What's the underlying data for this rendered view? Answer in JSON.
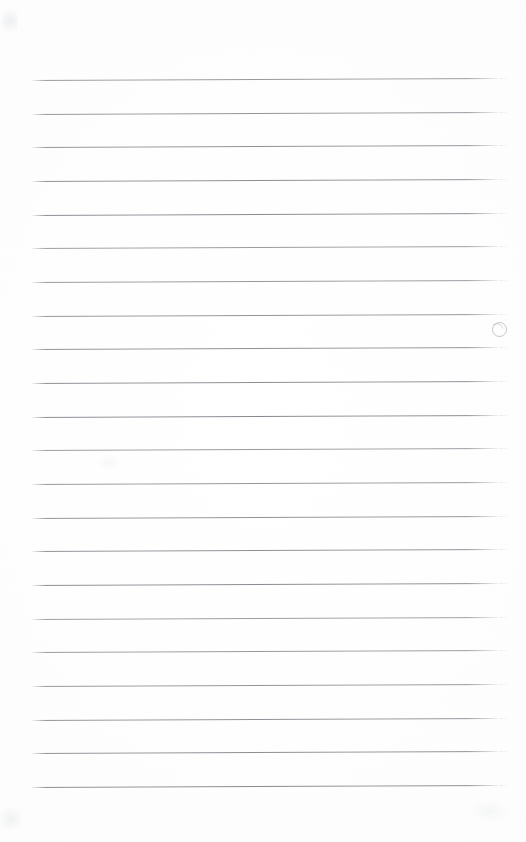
{
  "document": {
    "kind": "scanned-lined-paper",
    "title": "Blank ruled notebook page",
    "description": "Scanned sheet of blank lined writing paper with no handwriting or printed text",
    "page_width_px": 526,
    "page_height_px": 842,
    "has_text_content": "no",
    "content_text": ""
  },
  "paper": {
    "background_color": "#fdfdfd",
    "edge_color": "#f9f9f9",
    "rule_color": "#7e828a",
    "rule_color_light": "#aaaeb4"
  },
  "ruling": {
    "line_count": 22,
    "first_line_y": 80,
    "line_spacing_px": 33.7,
    "line_thickness_px": 1,
    "left_margin_x": 32,
    "right_end_x": 500,
    "line_length_px": 468,
    "tilt_degrees": -0.25,
    "top_margin_px": 80,
    "bottom_margin_px": 55,
    "lines": [
      {
        "index": 1,
        "y": 80,
        "content": ""
      },
      {
        "index": 2,
        "y": 114,
        "content": ""
      },
      {
        "index": 3,
        "y": 147,
        "content": ""
      },
      {
        "index": 4,
        "y": 181,
        "content": ""
      },
      {
        "index": 5,
        "y": 215,
        "content": ""
      },
      {
        "index": 6,
        "y": 248,
        "content": ""
      },
      {
        "index": 7,
        "y": 282,
        "content": ""
      },
      {
        "index": 8,
        "y": 316,
        "content": ""
      },
      {
        "index": 9,
        "y": 349,
        "content": ""
      },
      {
        "index": 10,
        "y": 383,
        "content": ""
      },
      {
        "index": 11,
        "y": 417,
        "content": ""
      },
      {
        "index": 12,
        "y": 450,
        "content": ""
      },
      {
        "index": 13,
        "y": 484,
        "content": ""
      },
      {
        "index": 14,
        "y": 518,
        "content": ""
      },
      {
        "index": 15,
        "y": 551,
        "content": ""
      },
      {
        "index": 16,
        "y": 585,
        "content": ""
      },
      {
        "index": 17,
        "y": 619,
        "content": ""
      },
      {
        "index": 18,
        "y": 652,
        "content": ""
      },
      {
        "index": 19,
        "y": 686,
        "content": ""
      },
      {
        "index": 20,
        "y": 720,
        "content": ""
      },
      {
        "index": 21,
        "y": 753,
        "content": ""
      },
      {
        "index": 22,
        "y": 787,
        "content": ""
      }
    ]
  },
  "marks": {
    "margin_mark": {
      "label": "faint circular ink mark",
      "x": 492,
      "y": 322,
      "diameter_px": 13,
      "color": "#969aa2"
    },
    "smudges": [
      {
        "label": "top-left corner smudge",
        "x": 2,
        "y": 6,
        "width": 16,
        "height": 30
      },
      {
        "label": "bottom-left corner smudge",
        "x": 0,
        "y": 806,
        "width": 22,
        "height": 26
      },
      {
        "label": "bottom-right edge smudge",
        "x": 470,
        "y": 800,
        "width": 40,
        "height": 22
      },
      {
        "label": "mid-page faint speck",
        "x": 96,
        "y": 454,
        "width": 26,
        "height": 16
      }
    ]
  }
}
